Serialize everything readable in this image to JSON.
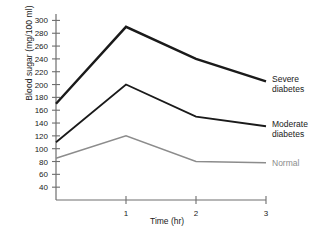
{
  "chart_data": {
    "type": "line",
    "title": "",
    "xlabel": "Time (hr)",
    "ylabel": "Blood sugar (mg/100 ml)",
    "x": [
      0,
      1,
      2,
      3
    ],
    "xlim": [
      0,
      3
    ],
    "ylim": [
      20,
      310
    ],
    "xticks": [
      "1",
      "2",
      "3"
    ],
    "xtick_values": [
      1,
      2,
      3
    ],
    "yticks": [
      "40",
      "60",
      "80",
      "100",
      "120",
      "140",
      "160",
      "180",
      "200",
      "220",
      "240",
      "260",
      "280",
      "300"
    ],
    "ytick_values": [
      40,
      60,
      80,
      100,
      120,
      140,
      160,
      180,
      200,
      220,
      240,
      260,
      280,
      300
    ],
    "grid": false,
    "legend_position": "inline-right-of-curve",
    "series": [
      {
        "name": "Severe diabetes",
        "label_line1": "Severe",
        "label_line2": "diabetes",
        "color": "#1a1a1a",
        "width": 2.4,
        "values": [
          170,
          290,
          240,
          205
        ]
      },
      {
        "name": "Moderate diabetes",
        "label_line1": "Moderate",
        "label_line2": "diabetes",
        "color": "#1a1a1a",
        "width": 1.8,
        "values": [
          110,
          200,
          150,
          135
        ]
      },
      {
        "name": "Normal",
        "label_line1": "Normal",
        "label_line2": "",
        "color": "#8c8c8c",
        "width": 1.5,
        "values": [
          85,
          120,
          80,
          78
        ]
      }
    ],
    "axis_color": "#6e6e6e"
  }
}
